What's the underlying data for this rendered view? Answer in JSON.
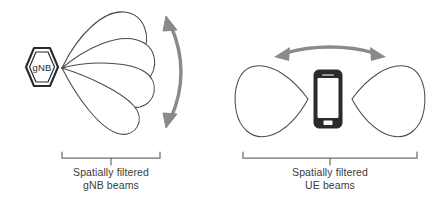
{
  "diagram": {
    "background_color": "#ffffff",
    "stroke_color": "#3b3b3b",
    "arrow_color": "#8a8a8a",
    "text_color": "#3b3b3b",
    "device_color": "#2b2b2b",
    "gnb_side": {
      "node_label": "gNB",
      "node_shape": "hexagon",
      "beam_count": 4,
      "beam_shape": "teardrop-lobe",
      "sweep_arrow": "curved-double-headed-arrow",
      "caption_line1": "Spatially filtered",
      "caption_line2": "gNB beams",
      "bracket": "bottom-bracket"
    },
    "ue_side": {
      "device_label": "smartphone",
      "beam_count": 2,
      "beam_shape": "rounded-triangle-lobe",
      "sweep_arrow": "straight-double-headed-arrow",
      "caption_line1": "Spatially filtered",
      "caption_line2": "UE beams",
      "bracket": "bottom-bracket"
    }
  }
}
